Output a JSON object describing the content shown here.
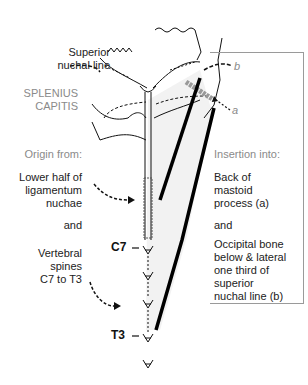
{
  "labels": {
    "superior_nuchal_line": [
      "Superior",
      "nuchal line"
    ],
    "muscle_name": [
      "SPLENIUS",
      "CAPITIS"
    ],
    "origin_heading": "Origin from:",
    "origin_items": [
      [
        "Lower half of",
        "ligamentum",
        "nuchae"
      ],
      [
        "and"
      ],
      [
        "Vertebral",
        "spines",
        "C7 to T3"
      ]
    ],
    "insertion_heading": "Insertion into:",
    "insertion_items": [
      [
        "Back of",
        "mastoid",
        "process (a)"
      ],
      [
        "and"
      ],
      [
        "Occipital bone",
        "below & lateral",
        "one third of",
        "superior",
        "nuchal line (b)"
      ]
    ],
    "vertebra_c7": "C7",
    "vertebra_t3": "T3",
    "marker_a": "a",
    "marker_b": "b"
  },
  "colors": {
    "text": "#222222",
    "muted_text": "#8a8a8a",
    "line": "#111111",
    "muscle_fill": "#f0f0f0",
    "box_border": "#9a9a9a"
  }
}
